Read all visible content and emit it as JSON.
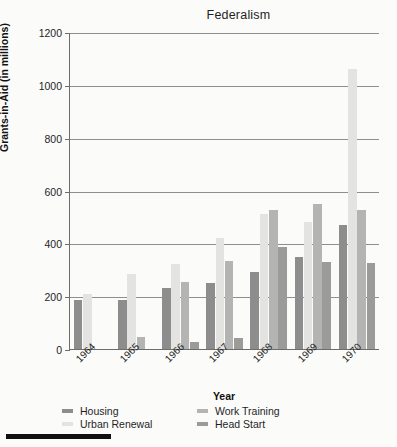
{
  "chart_data": {
    "type": "bar",
    "title": "Federalism",
    "xlabel": "Year",
    "ylabel": "Grants-in-Aid (in millions)",
    "categories": [
      "1964",
      "1965",
      "1966",
      "1967",
      "1968",
      "1969",
      "1970"
    ],
    "ylim": [
      0,
      1200
    ],
    "yticks": [
      0,
      200,
      400,
      600,
      800,
      1000,
      1200
    ],
    "ytick_labels": [
      "0",
      "200",
      "400",
      "600",
      "800",
      "1000",
      "1200"
    ],
    "grid": true,
    "legend_position": "bottom-left",
    "series": [
      {
        "name": "Housing",
        "color": "#8d8d8d",
        "values": [
          185,
          185,
          230,
          250,
          290,
          350,
          470
        ]
      },
      {
        "name": "Urban Renewal",
        "color": "#e3e3e1",
        "values": [
          210,
          285,
          320,
          420,
          510,
          480,
          1060
        ]
      },
      {
        "name": "Work Training",
        "color": "#b4b4b2",
        "values": [
          0,
          45,
          255,
          335,
          525,
          550,
          525
        ]
      },
      {
        "name": "Head Start",
        "color": "#9b9b99",
        "values": [
          0,
          0,
          25,
          40,
          385,
          330,
          325
        ]
      }
    ]
  },
  "legend": {
    "entries": [
      {
        "label": "Housing",
        "color": "#8d8d8d"
      },
      {
        "label": "Urban Renewal",
        "color": "#e3e3e1"
      },
      {
        "label": "Work Training",
        "color": "#b4b4b2"
      },
      {
        "label": "Head Start",
        "color": "#9b9b99"
      }
    ]
  }
}
